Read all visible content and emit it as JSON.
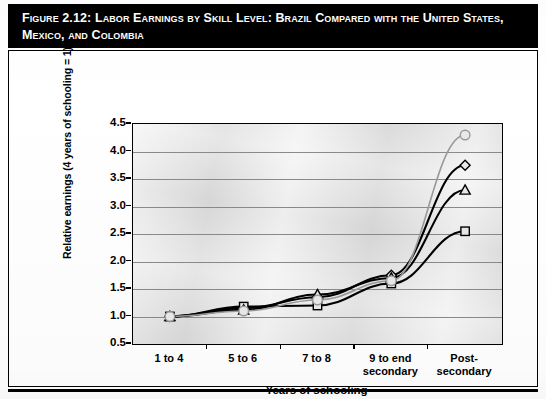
{
  "figure": {
    "number_label": "Figure 2.12:",
    "title": "Labor Earnings by Skill Level: Brazil Compared with the United States, Mexico, and Colombia"
  },
  "axes": {
    "y_title": "Relative earnings (4 years of schooling = 1)",
    "x_title": "Years of schooling",
    "y_ticks": [
      "4.5",
      "4.0",
      "3.5",
      "3.0",
      "2.5",
      "2.0",
      "1.5",
      "1.0",
      "0.5"
    ],
    "x_ticks": [
      "1 to 4",
      "5 to 6",
      "7 to 8",
      "9 to end secondary",
      "Post-secondary"
    ]
  },
  "legend": {
    "items": [
      {
        "label": "Brazil",
        "marker": "diamond",
        "color": "#000000"
      },
      {
        "label": "USA",
        "marker": "square",
        "color": "#000000"
      },
      {
        "label": "Mexico",
        "marker": "triangle",
        "color": "#000000"
      },
      {
        "label": "Colombia",
        "marker": "circle",
        "color": "#9a9a9a"
      }
    ]
  },
  "chart_data": {
    "type": "line",
    "title": "Labor Earnings by Skill Level: Brazil Compared with the United States, Mexico, and Colombia",
    "xlabel": "Years of schooling",
    "ylabel": "Relative earnings (4 years of schooling = 1)",
    "categories": [
      "1 to 4",
      "5 to 6",
      "7 to 8",
      "9 to end secondary",
      "Post-secondary"
    ],
    "ylim": [
      0.5,
      4.5
    ],
    "ytick_step": 0.5,
    "grid": true,
    "legend_position": "bottom",
    "series": [
      {
        "name": "Brazil",
        "marker": "diamond",
        "color": "#000000",
        "values": [
          1.0,
          1.15,
          1.35,
          1.75,
          3.75
        ]
      },
      {
        "name": "USA",
        "marker": "square",
        "color": "#000000",
        "values": [
          1.0,
          1.18,
          1.2,
          1.6,
          2.55
        ]
      },
      {
        "name": "Mexico",
        "marker": "triangle",
        "color": "#000000",
        "values": [
          1.0,
          1.12,
          1.4,
          1.7,
          3.3
        ]
      },
      {
        "name": "Colombia",
        "marker": "circle",
        "color": "#9a9a9a",
        "values": [
          1.0,
          1.1,
          1.3,
          1.65,
          4.3
        ]
      }
    ]
  }
}
